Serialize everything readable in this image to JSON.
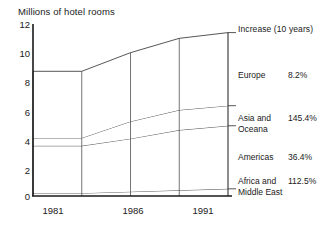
{
  "chart_data": {
    "type": "area",
    "title": "Millions of hotel rooms",
    "subtitle": "",
    "xlabel": "",
    "ylabel": "Millions of hotel rooms",
    "ylim": [
      0,
      12
    ],
    "yticks": [
      0,
      2,
      4,
      6,
      8,
      10,
      12
    ],
    "xticks": [
      "1981",
      "1986",
      "1991"
    ],
    "x": [
      1981,
      1983,
      1986,
      1989,
      1991
    ],
    "grid": true,
    "stacked": true,
    "legend_position": "right",
    "legend_header": "Increase (10 years)",
    "series": [
      {
        "name": "Africa and Middle East",
        "increase": "112.5%",
        "values": [
          0.2,
          0.2,
          0.3,
          0.4,
          0.5
        ]
      },
      {
        "name": "Americas",
        "increase": "36.4%",
        "values": [
          3.3,
          3.3,
          3.7,
          4.2,
          4.4
        ]
      },
      {
        "name": "Asia and Oceana",
        "increase": "145.4%",
        "values": [
          0.55,
          0.55,
          1.2,
          1.4,
          1.4
        ]
      },
      {
        "name": "Europe",
        "increase": "8.2%",
        "values": [
          4.65,
          4.65,
          4.8,
          5.0,
          5.1
        ]
      }
    ],
    "cumulative_tops": {
      "africa_middle_east": [
        0.2,
        0.2,
        0.3,
        0.4,
        0.5
      ],
      "americas": [
        3.5,
        3.5,
        4.0,
        4.6,
        4.9
      ],
      "asia_oceana": [
        4.05,
        4.05,
        5.2,
        6.0,
        6.3
      ],
      "europe": [
        8.7,
        8.7,
        10.0,
        11.0,
        11.4
      ]
    }
  },
  "chart": {
    "axis_title": "Millions of hotel rooms",
    "legend_header": "Increase (10 years)",
    "yticks": [
      "12",
      "10",
      "8",
      "6",
      "4",
      "2",
      "0"
    ],
    "xticks": [
      "1981",
      "1986",
      "1991"
    ],
    "legend": [
      {
        "name": "Europe",
        "name2": "",
        "value": "8.2%"
      },
      {
        "name": "Asia and",
        "name2": "Oceana",
        "value": "145.4%"
      },
      {
        "name": "Americas",
        "name2": "",
        "value": "36.4%"
      },
      {
        "name": "Africa and",
        "name2": "Middle East",
        "value": "112.5%"
      }
    ],
    "colors": {
      "line": "#2b2b2b",
      "text": "#1a1a1a",
      "background": "#ffffff"
    }
  }
}
